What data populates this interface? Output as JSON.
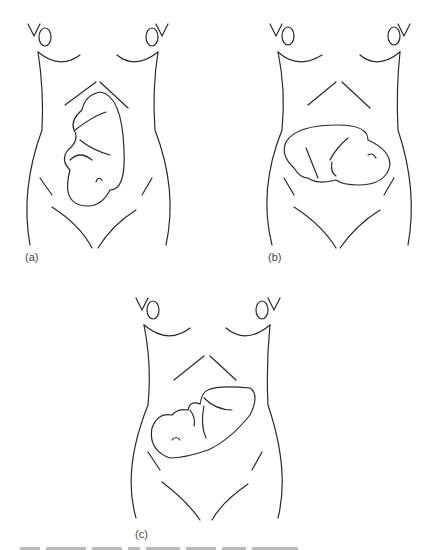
{
  "figure": {
    "panels": [
      {
        "id": "a",
        "label": "(a)",
        "fetal_lie": "longitudinal"
      },
      {
        "id": "b",
        "label": "(b)",
        "fetal_lie": "transverse"
      },
      {
        "id": "c",
        "label": "(c)",
        "fetal_lie": "oblique"
      }
    ],
    "caption_visible": false
  },
  "colors": {
    "line": "#2a2a2a",
    "background": "#ffffff"
  }
}
